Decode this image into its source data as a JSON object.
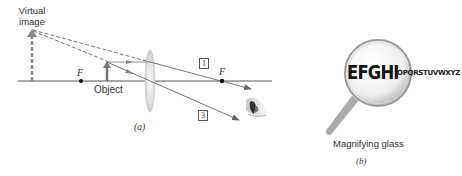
{
  "panel_a": {
    "virtual_image_label_line1": "Virtual",
    "virtual_image_label_line2": "image",
    "focal_point_left_label": "F",
    "focal_point_right_label": "F",
    "object_label": "Object",
    "ray_1_label": "1",
    "ray_3_label": "3",
    "caption": "(a)",
    "colors": {
      "axis": "#555555",
      "rays": "#666666",
      "dashed_rays": "#555555",
      "arrows": "#777777",
      "lens": "#d8d8d8"
    }
  },
  "panel_b": {
    "magnified_text": "EFGHI",
    "small_text": "OPQRSTUVWXYZ",
    "label": "Magnifying glass",
    "caption": "(b)"
  }
}
